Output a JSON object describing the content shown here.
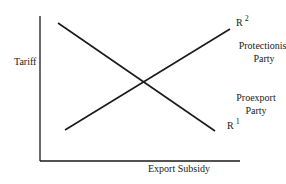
{
  "diagram": {
    "type": "two-line intersection diagram",
    "axes": {
      "y_label": "Tariff",
      "x_label": "Export Subsidy"
    },
    "curves": [
      {
        "id": "R1",
        "label_base": "R",
        "label_sup": "1",
        "direction": "downward-sloping",
        "party": "Proexport Party"
      },
      {
        "id": "R2",
        "label_base": "R",
        "label_sup": "2",
        "direction": "upward-sloping",
        "party": "Protectionist Party"
      }
    ],
    "party_labels": {
      "protectionist_line1": "Protectionist",
      "protectionist_line2": "Party",
      "proexport_line1": "Proexport",
      "proexport_line2": "Party"
    },
    "colors": {
      "line": "#1a1a1a",
      "background": "#ffffff"
    }
  }
}
